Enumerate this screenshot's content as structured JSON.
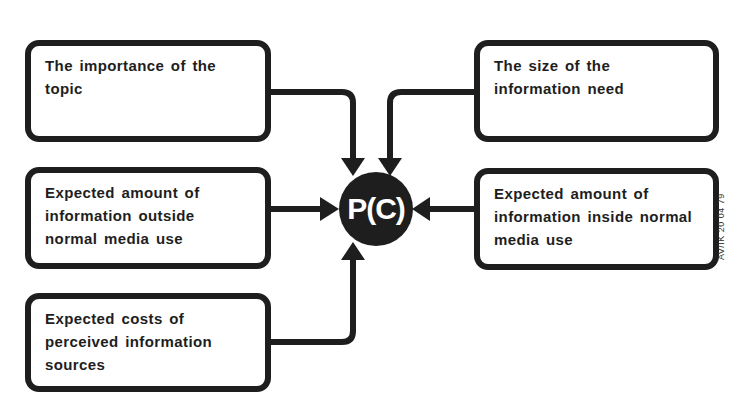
{
  "diagram": {
    "center_node": {
      "label": "P(C)"
    },
    "factors": [
      {
        "id": "importance",
        "label": "The importance of the topic",
        "position": "top-left"
      },
      {
        "id": "outside",
        "label": "Expected amount of information outside normal media use",
        "position": "middle-left"
      },
      {
        "id": "costs",
        "label": "Expected costs of perceived information sources",
        "position": "bottom-left"
      },
      {
        "id": "size",
        "label": "The size of the information need",
        "position": "top-right"
      },
      {
        "id": "inside",
        "label": "Expected amount of information inside normal media use",
        "position": "middle-right"
      }
    ],
    "figure_code": "AV/IK 20 04 79",
    "colors": {
      "ink": "#1e1e1e",
      "background": "#ffffff"
    }
  }
}
